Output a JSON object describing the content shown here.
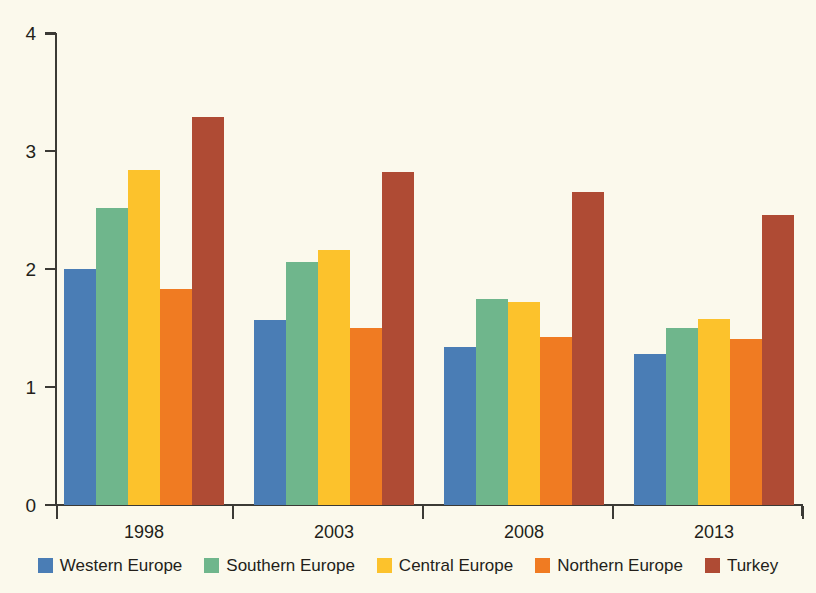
{
  "chart_data": {
    "type": "bar",
    "title": "",
    "subtitle": "",
    "xlabel": "",
    "ylabel": "",
    "categories": [
      "1998",
      "2003",
      "2008",
      "2013"
    ],
    "ylim": [
      0,
      4
    ],
    "yticks": [
      "0",
      "1",
      "2",
      "3",
      "4"
    ],
    "ytick_values": [
      0,
      1,
      2,
      3,
      4
    ],
    "grid": false,
    "legend_position": "bottom",
    "background_color": "#fbf9ec",
    "axis_color": "#3b3a35",
    "series": [
      {
        "name": "Western Europe",
        "color": "#4a7db5",
        "values": [
          2.0,
          1.57,
          1.34,
          1.28
        ]
      },
      {
        "name": "Southern Europe",
        "color": "#6fb68c",
        "values": [
          2.52,
          2.06,
          1.75,
          1.5
        ]
      },
      {
        "name": "Central Europe",
        "color": "#fcc22c",
        "values": [
          2.84,
          2.16,
          1.72,
          1.58
        ]
      },
      {
        "name": "Northern Europe",
        "color": "#f07b22",
        "values": [
          1.83,
          1.5,
          1.42,
          1.41
        ]
      },
      {
        "name": "Turkey",
        "color": "#af4b34",
        "values": [
          3.29,
          2.82,
          2.65,
          2.46
        ]
      }
    ]
  }
}
